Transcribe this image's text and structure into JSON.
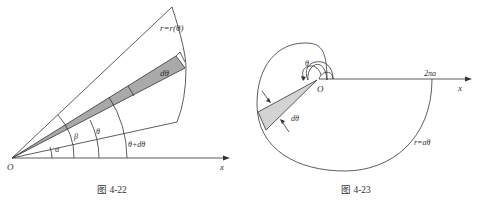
{
  "figures": [
    {
      "caption": "图 4-22",
      "labels": {
        "origin": "O",
        "x_axis": "x",
        "curve": "r=r(θ)",
        "d_theta": "dθ",
        "alpha": "α",
        "beta": "β",
        "theta": "θ",
        "theta_plus": "θ+dθ"
      },
      "colors": {
        "line": "#333333",
        "sector_fill": "#a9a9a9"
      }
    },
    {
      "caption": "图 4-23",
      "labels": {
        "origin": "O",
        "x_axis": "x",
        "intercept": "2πa",
        "curve": "r=aθ",
        "theta": "θ",
        "d_theta": "dθ"
      },
      "colors": {
        "line": "#333333",
        "sector_fill": "#d3d3d3"
      }
    }
  ]
}
